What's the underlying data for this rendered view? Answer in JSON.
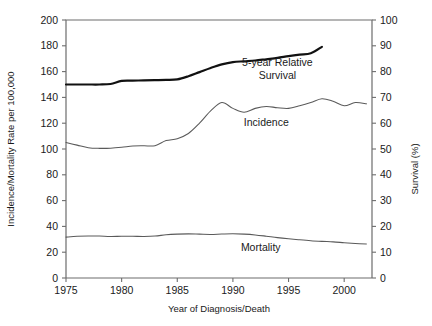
{
  "chart_data": {
    "type": "line",
    "title": "",
    "xlabel": "Year of Diagnosis/Death",
    "ylabel": "Incidence/Mortality Rate per 100,000",
    "y2label": "Survival (%)",
    "xlim": [
      1975,
      2002.5
    ],
    "ylim": [
      0,
      200
    ],
    "y2lim": [
      0,
      100
    ],
    "grid": false,
    "legend_position": "inline-annotations",
    "xticks": [
      1975,
      1980,
      1985,
      1990,
      1995,
      2000
    ],
    "xticklabels": [
      "1975",
      "1980",
      "1985",
      "1990",
      "1995",
      "2000"
    ],
    "yticks": [
      0,
      20,
      40,
      60,
      80,
      100,
      120,
      140,
      160,
      180,
      200
    ],
    "yticklabels": [
      "0",
      "20",
      "40",
      "60",
      "80",
      "100",
      "120",
      "140",
      "160",
      "180",
      "200"
    ],
    "y2ticks": [
      0,
      10,
      20,
      30,
      40,
      50,
      60,
      70,
      80,
      90,
      100
    ],
    "y2ticklabels": [
      "0",
      "10",
      "20",
      "30",
      "40",
      "50",
      "60",
      "70",
      "80",
      "90",
      "100"
    ],
    "series": [
      {
        "name": "5-year Relative Survival",
        "axis": "right",
        "style": "bold",
        "label_text": [
          "5-year Relative",
          "Survival"
        ],
        "label_x": 1994.0,
        "label_y": 82.0,
        "x": [
          1975,
          1976,
          1977,
          1978,
          1979,
          1980,
          1981,
          1982,
          1983,
          1984,
          1985,
          1986,
          1987,
          1988,
          1989,
          1990,
          1991,
          1992,
          1993,
          1994,
          1995,
          1996,
          1997,
          1998
        ],
        "values": [
          75.0,
          75.0,
          75.0,
          75.0,
          75.2,
          76.4,
          76.5,
          76.6,
          76.7,
          76.8,
          77.0,
          78.2,
          79.8,
          81.4,
          82.8,
          83.7,
          84.0,
          84.3,
          84.8,
          85.3,
          86.0,
          86.6,
          87.1,
          89.6
        ]
      },
      {
        "name": "Incidence",
        "axis": "left",
        "style": "thin",
        "label_text": [
          "Incidence"
        ],
        "label_x": 1993.0,
        "label_y": 118.0,
        "x": [
          1975,
          1976,
          1977,
          1978,
          1979,
          1980,
          1981,
          1982,
          1983,
          1984,
          1985,
          1986,
          1987,
          1988,
          1989,
          1990,
          1991,
          1992,
          1993,
          1994,
          1995,
          1996,
          1997,
          1998,
          1999,
          2000,
          2001,
          2002
        ],
        "values": [
          105.0,
          103.0,
          101.0,
          100.5,
          100.6,
          101.3,
          102.3,
          102.5,
          102.6,
          106.5,
          108.0,
          112.0,
          120.0,
          129.5,
          136.0,
          131.5,
          128.5,
          131.5,
          133.0,
          132.0,
          131.5,
          133.5,
          136.0,
          139.0,
          137.0,
          133.5,
          136.0,
          135.0
        ]
      },
      {
        "name": "Mortality",
        "axis": "left",
        "style": "thin",
        "label_text": [
          "Mortality"
        ],
        "label_x": 1992.5,
        "label_y": 21.0,
        "x": [
          1975,
          1976,
          1977,
          1978,
          1979,
          1980,
          1981,
          1982,
          1983,
          1984,
          1985,
          1986,
          1987,
          1988,
          1989,
          1990,
          1991,
          1992,
          1993,
          1994,
          1995,
          1996,
          1997,
          1998,
          1999,
          2000,
          2001,
          2002
        ],
        "values": [
          31.7,
          32.3,
          32.6,
          32.5,
          32.2,
          32.3,
          32.3,
          32.2,
          32.5,
          33.5,
          34.0,
          34.2,
          34.0,
          33.8,
          34.1,
          34.3,
          34.0,
          33.4,
          32.4,
          31.3,
          30.4,
          29.6,
          28.9,
          28.4,
          28.0,
          27.4,
          26.8,
          26.3
        ]
      }
    ]
  }
}
